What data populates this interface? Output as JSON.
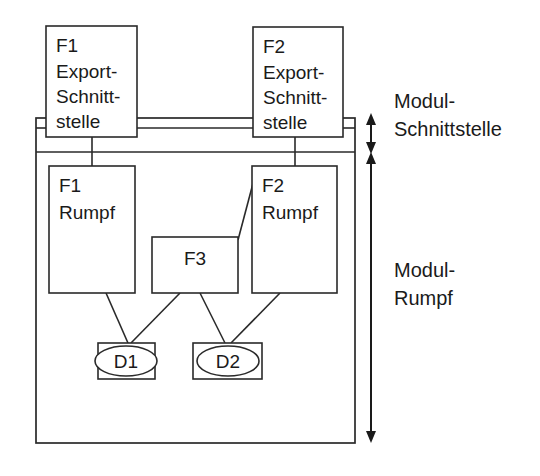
{
  "diagram": {
    "nodes": [
      {
        "id": "f1-export",
        "lines": [
          "F1",
          "Export-",
          "Schnitt-",
          "stelle"
        ],
        "x": 46,
        "y": 26,
        "w": 91,
        "h": 111
      },
      {
        "id": "f2-export",
        "lines": [
          "F2",
          "Export-",
          "Schnitt-",
          "stelle"
        ],
        "x": 253,
        "y": 27,
        "w": 90,
        "h": 110
      },
      {
        "id": "f1-rumpf",
        "lines": [
          "F1",
          "Rumpf"
        ],
        "x": 49,
        "y": 166,
        "w": 86,
        "h": 127
      },
      {
        "id": "f2-rumpf",
        "lines": [
          "F2",
          "Rumpf"
        ],
        "x": 252,
        "y": 166,
        "w": 85,
        "h": 127
      },
      {
        "id": "f3",
        "lines": [
          "F3"
        ],
        "x": 152,
        "y": 237,
        "w": 86,
        "h": 56
      },
      {
        "id": "d1",
        "lines": [
          "D1"
        ],
        "x": 98,
        "y": 343,
        "w": 57,
        "h": 36
      },
      {
        "id": "d2",
        "lines": [
          "D2"
        ],
        "x": 193,
        "y": 343,
        "w": 69,
        "h": 36
      }
    ],
    "labels": {
      "modul_schnittstelle_line1": "Modul-",
      "modul_schnittstelle_line2": "Schnittstelle",
      "modul_rumpf_line1": "Modul-",
      "modul_rumpf_line2": "Rumpf"
    },
    "colors": {
      "stroke": "#2a2a2a",
      "text": "#1a1a1a",
      "background": "#ffffff"
    }
  }
}
